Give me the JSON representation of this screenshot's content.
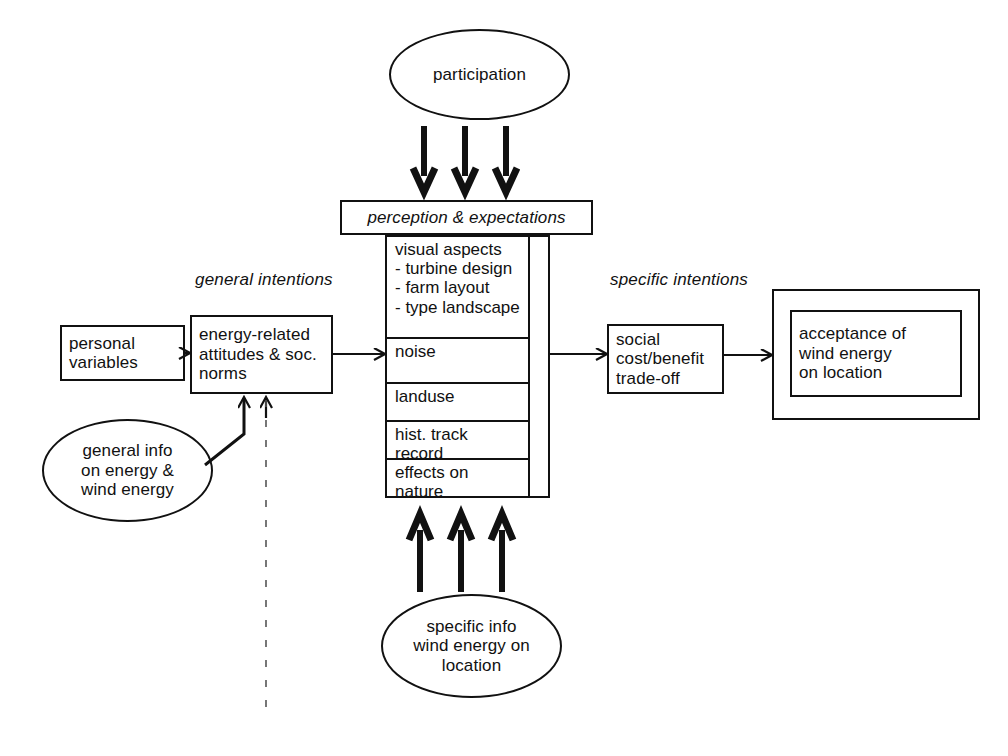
{
  "diagram": {
    "stroke_color": "#111111",
    "background_color": "#ffffff"
  },
  "labels": {
    "general_intentions": "general intentions",
    "specific_intentions": "specific intentions"
  },
  "ellipses": {
    "participation": "participation",
    "general_info": "general info\non energy &\nwind energy",
    "specific_info": "specific info\nwind energy on\nlocation"
  },
  "boxes": {
    "personal_variables": "personal\nvariables",
    "energy_related": "energy-related\nattitudes & soc.\nnorms",
    "perception_header": "perception & expectations",
    "social_tradeoff": "social\ncost/benefit\ntrade-off",
    "acceptance": "acceptance of\nwind energy\non location"
  },
  "perception_rows": [
    "visual aspects\n- turbine design\n- farm layout\n- type landscape",
    "noise",
    "landuse",
    "hist. track record",
    "effects on nature"
  ],
  "connectors": {
    "participation_to_perception": "three thick down arrows",
    "specific_info_to_perception": "three thick up arrows",
    "general_info_to_attitudes": "elbow arrow",
    "personal_to_attitudes": "arrow",
    "attitudes_to_perception": "arrow",
    "perception_to_tradeoff": "arrow",
    "tradeoff_to_acceptance": "arrow",
    "dashed_divider": "vertical dashed line"
  }
}
